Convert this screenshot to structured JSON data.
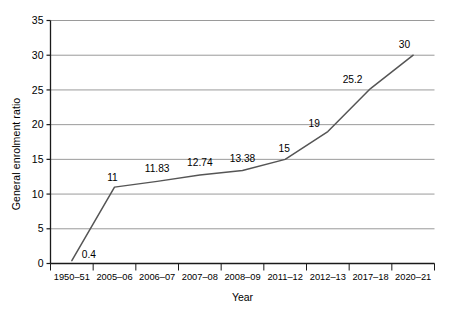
{
  "chart_data": {
    "type": "line",
    "title": "",
    "xlabel": "Year",
    "ylabel": "General enrolment ratio",
    "categories": [
      "1950–51",
      "2005–06",
      "2006–07",
      "2007–08",
      "2008–09",
      "2011–12",
      "2012–13",
      "2017–18",
      "2020–21"
    ],
    "values": [
      0.4,
      11,
      11.83,
      12.74,
      13.38,
      15,
      19,
      25.2,
      30
    ],
    "point_labels": [
      "0.4",
      "11",
      "11.83",
      "12.74",
      "13.38",
      "15",
      "19",
      "25.2",
      "30"
    ],
    "ylim": [
      0,
      35
    ],
    "yticks": [
      0,
      5,
      10,
      15,
      20,
      25,
      30,
      35
    ],
    "ytick_labels": [
      "0",
      "5",
      "10",
      "15",
      "20",
      "25",
      "30",
      "35"
    ],
    "grid": true,
    "grid_axis": "y",
    "legend": false,
    "legend_position": "none",
    "series_color": "#555555",
    "grid_color": "#9a9a9a",
    "axis_color": "#1a1a1a",
    "background_color": "#ffffff"
  }
}
